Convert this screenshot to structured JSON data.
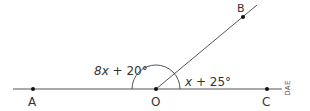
{
  "diagram": {
    "points": [
      {
        "name": "A",
        "label": "A"
      },
      {
        "name": "O",
        "label": "O"
      },
      {
        "name": "C",
        "label": "C"
      },
      {
        "name": "B",
        "label": "B"
      }
    ],
    "angles": {
      "left": {
        "var": "8x",
        "rest": " + 20°",
        "full": "8x + 20°",
        "between": "AOB"
      },
      "right": {
        "var": "x",
        "rest": " + 25°",
        "full": "x + 25°",
        "between": "BOC"
      }
    },
    "code_label": "DAE",
    "colors": {
      "line": "#555555",
      "point": "#111111",
      "text": "#333333"
    }
  }
}
